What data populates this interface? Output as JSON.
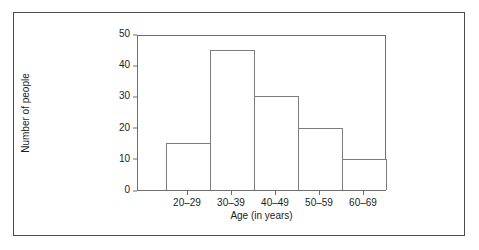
{
  "figure": {
    "background_color": "#ffffff",
    "frame_color": "#4a4a4a",
    "axis_color": "#6e6e6e",
    "bar_outline_color": "#7d7d7d",
    "bar_fill_color": "#ffffff",
    "text_color": "#1c1c1c"
  },
  "chart_data": {
    "type": "bar",
    "title": "",
    "subtitle": "",
    "xlabel": "Age (in years)",
    "ylabel": "Number of people",
    "categories": [
      "20–29",
      "30–39",
      "40–49",
      "50–59",
      "60–69"
    ],
    "values": [
      15,
      45,
      30,
      20,
      10
    ],
    "ylim": [
      0,
      50
    ],
    "ytick_labels": [
      "0",
      "10",
      "20",
      "30",
      "40",
      "50"
    ],
    "ytick_values": [
      0,
      10,
      20,
      30,
      40,
      50
    ],
    "xtick_labels": [
      "20–29",
      "30–39",
      "40–49",
      "50–59",
      "60–69"
    ],
    "grid": false,
    "legend": null,
    "legend_position": "none",
    "annotations": [],
    "bar_style": "unfilled-outline",
    "bars_adjacent": true
  }
}
